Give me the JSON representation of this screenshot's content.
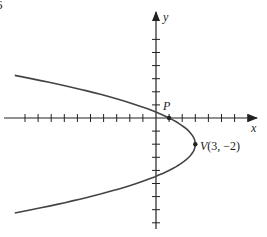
{
  "figure": {
    "figure_number": "6",
    "x_axis_label": "x",
    "y_axis_label": "y",
    "point_p_label": "P",
    "vertex_label_prefix": "V",
    "vertex_label_coords": "(3, −2)"
  },
  "chart_data": {
    "type": "line",
    "title": "",
    "xlabel": "x",
    "ylabel": "y",
    "equation": "x = -0.5(y + 2)^2 + 3",
    "vertex": {
      "label": "V(3, −2)",
      "x": 3,
      "y": -2
    },
    "points": [
      {
        "label": "P",
        "x": 1,
        "y": 0
      },
      {
        "label": "V",
        "x": 3,
        "y": -2
      }
    ],
    "x_ticks": [
      -10,
      -9,
      -8,
      -7,
      -6,
      -5,
      -4,
      -3,
      -2,
      -1,
      1,
      2,
      3,
      4,
      5,
      6,
      7
    ],
    "y_ticks": [
      6,
      5,
      4,
      3,
      2,
      1,
      -1,
      -2,
      -3,
      -4,
      -5,
      -6,
      -7,
      -8
    ],
    "xlim": [
      -11.5,
      7.7
    ],
    "ylim": [
      -8.2,
      7.9
    ],
    "grid": false
  }
}
